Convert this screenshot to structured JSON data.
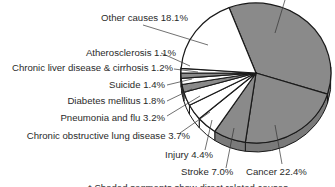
{
  "chart_data": {
    "type": "pie",
    "title": "",
    "style": "3d-pie",
    "start_angle_deg": -111,
    "slices": [
      {
        "label": "Heart disease",
        "value": 35.7,
        "shaded": true,
        "label_visible": false
      },
      {
        "label": "Cancer",
        "value": 22.4,
        "shaded": true
      },
      {
        "label": "Stroke",
        "value": 7.0,
        "shaded": true
      },
      {
        "label": "Injury",
        "value": 4.4,
        "shaded": false
      },
      {
        "label": "Chronic obstructive lung disease",
        "value": 3.7,
        "shaded": false
      },
      {
        "label": "Pneumonia and flu",
        "value": 3.2,
        "shaded": false
      },
      {
        "label": "Diabetes mellitus",
        "value": 1.8,
        "shaded": true
      },
      {
        "label": "Suicide",
        "value": 1.4,
        "shaded": false
      },
      {
        "label": "Chronic liver disease & cirrhosis",
        "value": 1.2,
        "shaded": true
      },
      {
        "label": "Atherosclerosis",
        "value": 1.1,
        "shaded": false
      },
      {
        "label": "Other causes",
        "value": 18.1,
        "shaded": false
      }
    ],
    "labels_text": [
      "Other causes 18.1%",
      "Atherosclerosis 1.1%",
      "Chronic liver disease & cirrhosis 1.2%",
      "Suicide 1.4%",
      "Diabetes mellitus 1.8%",
      "Pneumonia and flu 3.2%",
      "Chronic obstructive lung disease 3.7%",
      "Injury 4.4%",
      "Stroke 7.0%",
      "Cancer 22.4%"
    ],
    "footnote": "* Shaded segments show direct related causes",
    "colors": {
      "shaded": "#8a8a8a",
      "unshaded": "#ffffff",
      "edge": "#1a1a1a"
    }
  },
  "labels": {
    "other": "Other causes 18.1%",
    "athero": "Atherosclerosis 1.1%",
    "liver": "Chronic liver disease & cirrhosis 1.2%",
    "suicide": "Suicide 1.4%",
    "diabetes": "Diabetes mellitus 1.8%",
    "pneumonia": "Pneumonia and flu 3.2%",
    "copd": "Chronic obstructive lung disease 3.7%",
    "injury": "Injury 4.4%",
    "stroke": "Stroke 7.0%",
    "cancer": "Cancer 22.4%"
  },
  "footnote": "* Shaded segments show direct related causes"
}
